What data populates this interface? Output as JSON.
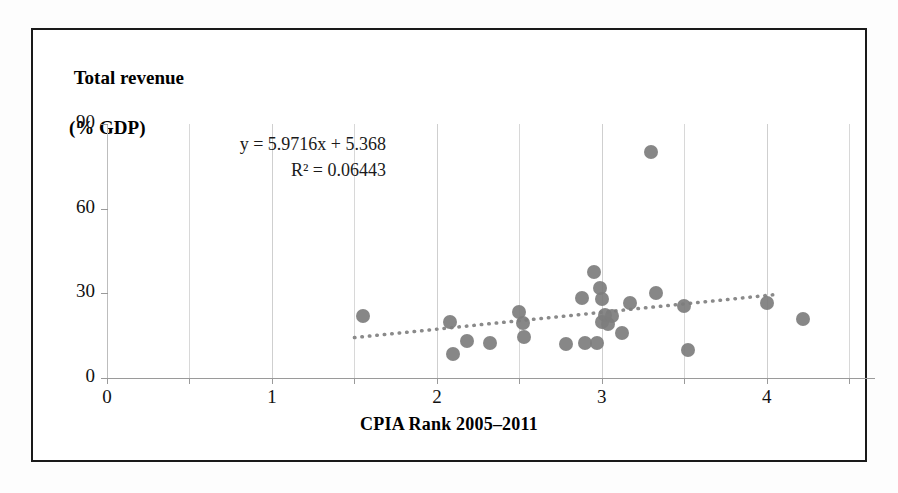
{
  "chart_data": {
    "type": "scatter",
    "title": "",
    "xlabel": "CPIA Rank 2005–2011",
    "ylabel": "Total revenue (% GDP)",
    "ylabel_line1": "Total revenue",
    "ylabel_line2": "(% GDP)",
    "xlim": [
      0,
      4.65
    ],
    "ylim": [
      0,
      90
    ],
    "xticks": [
      0,
      1,
      2,
      3,
      4
    ],
    "xtick_labels": [
      "0",
      "1",
      "2",
      "3",
      "4"
    ],
    "xminor_ticks": [
      0.5,
      1.5,
      2.5,
      3.5,
      4.5
    ],
    "yticks": [
      0,
      30,
      60,
      90
    ],
    "ytick_labels": [
      "0",
      "30",
      "60",
      "90"
    ],
    "grid": "vertical-only",
    "legend": "none",
    "marker_color": "#7d7d7d",
    "trendline": {
      "equation": "y = 5.9716x + 5.368",
      "r_squared_label": "R² = 0.06443",
      "slope": 5.9716,
      "intercept": 5.368,
      "r_squared": 0.06443,
      "style": "dotted",
      "color": "#8a8a8a",
      "x_start": 1.5,
      "x_end": 4.05
    },
    "points": [
      {
        "x": 1.55,
        "y": 22.0
      },
      {
        "x": 2.08,
        "y": 20.0
      },
      {
        "x": 2.1,
        "y": 8.5
      },
      {
        "x": 2.18,
        "y": 13.0
      },
      {
        "x": 2.32,
        "y": 12.5
      },
      {
        "x": 2.5,
        "y": 23.5
      },
      {
        "x": 2.52,
        "y": 19.5
      },
      {
        "x": 2.53,
        "y": 14.5
      },
      {
        "x": 2.78,
        "y": 12.0
      },
      {
        "x": 2.88,
        "y": 28.5
      },
      {
        "x": 2.9,
        "y": 12.5
      },
      {
        "x": 2.95,
        "y": 37.5
      },
      {
        "x": 2.97,
        "y": 12.5
      },
      {
        "x": 2.99,
        "y": 32.0
      },
      {
        "x": 3.0,
        "y": 28.0
      },
      {
        "x": 3.0,
        "y": 20.0
      },
      {
        "x": 3.02,
        "y": 22.5
      },
      {
        "x": 3.04,
        "y": 19.0
      },
      {
        "x": 3.06,
        "y": 22.0
      },
      {
        "x": 3.12,
        "y": 16.0
      },
      {
        "x": 3.17,
        "y": 26.5
      },
      {
        "x": 3.3,
        "y": 80.0
      },
      {
        "x": 3.33,
        "y": 30.0
      },
      {
        "x": 3.5,
        "y": 25.5
      },
      {
        "x": 3.52,
        "y": 10.0
      },
      {
        "x": 4.0,
        "y": 26.5
      },
      {
        "x": 4.22,
        "y": 21.0
      }
    ]
  }
}
